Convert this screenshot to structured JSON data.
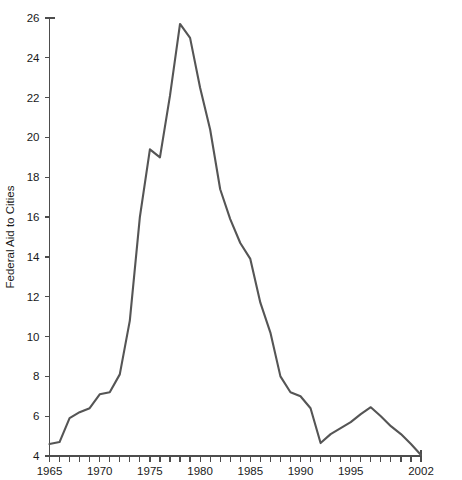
{
  "chart_data": {
    "type": "line",
    "title": "",
    "subtitle": "",
    "xlabel": "",
    "ylabel": "Federal Aid to Cities",
    "xlim": [
      1965,
      2002
    ],
    "ylim": [
      4,
      26
    ],
    "grid": false,
    "legend": null,
    "line_color": "#555555",
    "axis_color": "#4d4d4d",
    "x_tick_step": 1,
    "y_tick_step": 2,
    "x_tick_labels": [
      "1965",
      "1970",
      "1975",
      "1980",
      "1985",
      "1990",
      "1995",
      "2002"
    ],
    "x_tick_label_values": [
      1965,
      1970,
      1975,
      1980,
      1985,
      1990,
      1995,
      2002
    ],
    "y_tick_labels": [
      "4",
      "6",
      "8",
      "10",
      "12",
      "14",
      "16",
      "18",
      "20",
      "22",
      "24",
      "26"
    ],
    "y_tick_label_values": [
      4,
      6,
      8,
      10,
      12,
      14,
      16,
      18,
      20,
      22,
      24,
      26
    ],
    "x": [
      1965,
      1966,
      1967,
      1968,
      1969,
      1970,
      1971,
      1972,
      1973,
      1974,
      1975,
      1976,
      1977,
      1978,
      1979,
      1980,
      1981,
      1982,
      1983,
      1984,
      1985,
      1986,
      1987,
      1988,
      1989,
      1990,
      1991,
      1992,
      1993,
      1994,
      1995,
      1996,
      1997,
      1998,
      1999,
      2000,
      2001,
      2002
    ],
    "values": [
      4.6,
      4.7,
      5.9,
      6.2,
      6.4,
      7.1,
      7.2,
      8.1,
      10.8,
      16.0,
      19.4,
      19.0,
      22.1,
      25.7,
      25.0,
      22.5,
      20.4,
      17.4,
      15.9,
      14.7,
      13.9,
      11.7,
      10.2,
      8.0,
      7.2,
      7.0,
      6.4,
      4.65,
      5.1,
      5.4,
      5.7,
      6.1,
      6.45,
      6.0,
      5.5,
      5.1,
      4.6,
      4.05
    ],
    "series": [
      {
        "name": "Federal Aid to Cities",
        "values": [
          4.6,
          4.7,
          5.9,
          6.2,
          6.4,
          7.1,
          7.2,
          8.1,
          10.8,
          16.0,
          19.4,
          19.0,
          22.1,
          25.7,
          25.0,
          22.5,
          20.4,
          17.4,
          15.9,
          14.7,
          13.9,
          11.7,
          10.2,
          8.0,
          7.2,
          7.0,
          6.4,
          4.65,
          5.1,
          5.4,
          5.7,
          6.1,
          6.45,
          6.0,
          5.5,
          5.1,
          4.6,
          4.05
        ]
      }
    ],
    "annotations": []
  }
}
